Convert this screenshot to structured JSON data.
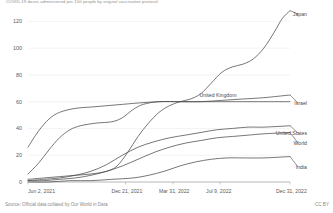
{
  "chart_data": {
    "type": "line",
    "title": "COVID-19 doses administered per 100 people by original vaccination protocol",
    "xlabel": "",
    "ylabel": "",
    "ylim": [
      0,
      130
    ],
    "xlim": [
      "Jun 2, 2021",
      "Dec 31, 2022"
    ],
    "grid": true,
    "legend_position": "right-inline",
    "y_ticks": [
      "0",
      "20",
      "40",
      "60",
      "80",
      "100",
      "120"
    ],
    "y_tick_values": [
      0,
      20,
      40,
      60,
      80,
      100,
      120
    ],
    "x_ticks": [
      "Jun 2, 2021",
      "Dec 21, 2021",
      "Mar 31, 2022",
      "Jul 9, 2022",
      "Dec 31, 2022"
    ],
    "x_tick_values": [
      0,
      0.372,
      0.553,
      0.733,
      1.0
    ],
    "series": [
      {
        "name": "Japan",
        "color": "#4a4a4a",
        "label_x": 307,
        "label_y": 14,
        "x": [
          0.0,
          0.06,
          0.12,
          0.18,
          0.24,
          0.3,
          0.34,
          0.38,
          0.42,
          0.46,
          0.5,
          0.54,
          0.58,
          0.62,
          0.66,
          0.7,
          0.74,
          0.78,
          0.82,
          0.86,
          0.9,
          0.94,
          0.97,
          1.0
        ],
        "values": [
          2,
          3,
          4,
          5,
          6,
          8,
          12,
          22,
          34,
          44,
          52,
          57,
          60,
          62,
          66,
          74,
          82,
          86,
          88,
          92,
          100,
          112,
          122,
          128
        ]
      },
      {
        "name": "Israel",
        "color": "#4a4a4a",
        "label_x": 307,
        "label_y": 103,
        "x": [
          0.0,
          0.04,
          0.08,
          0.12,
          0.18,
          0.24,
          0.3,
          0.36,
          0.42,
          0.5,
          0.58,
          0.66,
          0.74,
          0.82,
          0.9,
          1.0
        ],
        "values": [
          26,
          38,
          47,
          52,
          55,
          56,
          57,
          58,
          59,
          60,
          60,
          60,
          61,
          62,
          63,
          65
        ]
      },
      {
        "name": "United Kingdom",
        "color": "#4a4a4a",
        "label_x": 218,
        "label_y": 95,
        "x": [
          0.0,
          0.04,
          0.08,
          0.12,
          0.16,
          0.2,
          0.26,
          0.32,
          0.36,
          0.4,
          0.44,
          0.5,
          0.58,
          0.66,
          0.74,
          0.82,
          0.9,
          1.0
        ],
        "values": [
          6,
          14,
          24,
          33,
          39,
          42,
          44,
          45,
          48,
          54,
          58,
          60,
          60,
          60,
          60,
          60,
          60,
          60
        ]
      },
      {
        "name": "United States",
        "color": "#4a4a4a",
        "label_x": 307,
        "label_y": 133,
        "x": [
          0.0,
          0.06,
          0.12,
          0.18,
          0.24,
          0.3,
          0.36,
          0.42,
          0.48,
          0.54,
          0.6,
          0.66,
          0.72,
          0.78,
          0.84,
          0.9,
          1.0
        ],
        "values": [
          1,
          2,
          3,
          5,
          8,
          13,
          20,
          26,
          30,
          33,
          35,
          37,
          39,
          40,
          41,
          41,
          42
        ]
      },
      {
        "name": "World",
        "color": "#4a4a4a",
        "label_x": 307,
        "label_y": 143,
        "x": [
          0.0,
          0.06,
          0.12,
          0.18,
          0.24,
          0.3,
          0.36,
          0.42,
          0.48,
          0.54,
          0.6,
          0.66,
          0.72,
          0.78,
          0.84,
          0.9,
          1.0
        ],
        "values": [
          1,
          1,
          2,
          3,
          5,
          8,
          12,
          17,
          22,
          26,
          29,
          31,
          33,
          34,
          35,
          36,
          37
        ]
      },
      {
        "name": "India",
        "color": "#4a4a4a",
        "label_x": 307,
        "label_y": 167,
        "x": [
          0.0,
          0.08,
          0.16,
          0.24,
          0.32,
          0.4,
          0.46,
          0.52,
          0.58,
          0.64,
          0.7,
          0.76,
          0.82,
          0.9,
          1.0
        ],
        "values": [
          0,
          0,
          1,
          1,
          2,
          3,
          5,
          8,
          12,
          15,
          17,
          18,
          18,
          18,
          19
        ]
      }
    ]
  },
  "footer": {
    "source": "Source: Official data collated by Our World in Data",
    "license": "CC BY"
  }
}
